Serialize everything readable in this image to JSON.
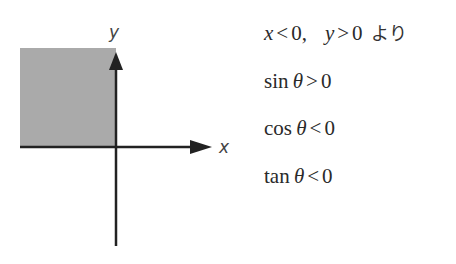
{
  "diagram": {
    "type": "coordinate-plane",
    "x_axis_label": "x",
    "y_axis_label": "y",
    "shaded_quadrant": "second (x<0, y>0)",
    "colors": {
      "shade": "#aaaaaa",
      "axis": "#222222"
    }
  },
  "conditions": {
    "premise": {
      "x_var": "x",
      "x_op": "<",
      "x_val": "0",
      "sep": ",",
      "y_var": "y",
      "y_op": ">",
      "y_val": "0",
      "suffix": "より"
    },
    "lines": [
      {
        "func": "sin",
        "var": "θ",
        "op": ">",
        "val": "0"
      },
      {
        "func": "cos",
        "var": "θ",
        "op": "<",
        "val": "0"
      },
      {
        "func": "tan",
        "var": "θ",
        "op": "<",
        "val": "0"
      }
    ]
  }
}
